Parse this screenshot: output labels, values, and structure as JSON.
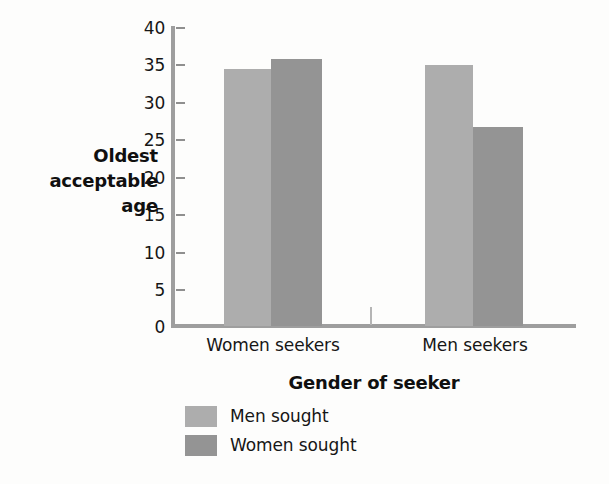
{
  "chart_data": {
    "type": "bar",
    "title": "",
    "xlabel": "Gender of seeker",
    "ylabel": "Oldest acceptable age",
    "ylabel_lines": [
      "Oldest",
      "acceptable",
      "age"
    ],
    "categories": [
      "Women seekers",
      "Men seekers"
    ],
    "series": [
      {
        "name": "Men sought",
        "color": "#adadad",
        "values": [
          34.5,
          35.0
        ]
      },
      {
        "name": "Women sought",
        "color": "#949494",
        "values": [
          35.8,
          26.7
        ]
      }
    ],
    "ylim": [
      0,
      40
    ],
    "yticks": [
      0,
      5,
      10,
      15,
      20,
      25,
      30,
      35,
      40
    ],
    "ytick_labels": [
      "0",
      "5",
      "10",
      "15",
      "20",
      "25",
      "30",
      "35",
      "40"
    ],
    "grid": false,
    "legend_position": "bottom-left",
    "orientation": "vertical",
    "grouped": true
  },
  "axes": {
    "y_title_line1": "Oldest",
    "y_title_line2": "acceptable",
    "y_title_line3": "age",
    "x_title": "Gender of seeker",
    "tick_40": "40",
    "tick_35": "35",
    "tick_30": "30",
    "tick_25": "25",
    "tick_20": "20",
    "tick_15": "15",
    "tick_10": "10",
    "tick_5": "5",
    "tick_0": "0",
    "cat_1": "Women seekers",
    "cat_2": "Men seekers"
  },
  "legend": {
    "entries": [
      {
        "label": "Men sought",
        "color": "#adadad"
      },
      {
        "label": "Women sought",
        "color": "#949494"
      }
    ]
  }
}
